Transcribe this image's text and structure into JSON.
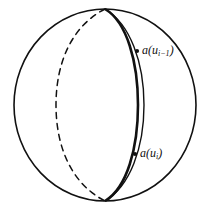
{
  "figure": {
    "background_color": "#ffffff",
    "stroke_color": "#111111",
    "canvas": {
      "width": 212,
      "height": 214
    },
    "sphere": {
      "name": "sphere-outline",
      "center_x": 105,
      "center_y": 105,
      "radius_x": 91,
      "radius_y": 96
    },
    "poles": {
      "north": {
        "x": 105,
        "y": 9
      },
      "south": {
        "x": 105,
        "y": 201
      }
    },
    "arcs": [
      {
        "id": "hidden-meridian",
        "style": "dashed",
        "stroke_width": 1.4,
        "bulge_x": 58,
        "description": "hidden back meridian drawn dashed"
      },
      {
        "id": "thin-meridian",
        "style": "solid",
        "stroke_width": 1.4,
        "bulge_x": 118,
        "description": "thin front meridian"
      },
      {
        "id": "thick-meridian",
        "style": "solid",
        "stroke_width": 2.6,
        "bulge_x": 142,
        "description": "thick front meridian carrying the labelled points"
      }
    ],
    "points": [
      {
        "id": "point-upper",
        "label": "a(u",
        "label_sub": "i−1",
        "label_tail": ")",
        "x": 137,
        "y": 51,
        "label_x": 142,
        "label_y": 51
      },
      {
        "id": "point-lower",
        "label": "a(u",
        "label_sub": "i",
        "label_tail": ")",
        "x": 135,
        "y": 154,
        "label_x": 140,
        "label_y": 154
      }
    ]
  }
}
